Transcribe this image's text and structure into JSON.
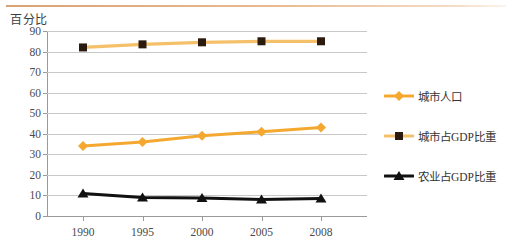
{
  "chart_data": {
    "type": "line",
    "title": "百分比",
    "xlabel": "",
    "ylabel": "百分比",
    "categories": [
      "1990",
      "1995",
      "2000",
      "2005",
      "2008"
    ],
    "x": [
      1990,
      1995,
      2000,
      2005,
      2008
    ],
    "ylim": [
      0,
      90
    ],
    "yticks": [
      0,
      10,
      20,
      30,
      40,
      50,
      60,
      70,
      80,
      90
    ],
    "ytick_labels": [
      "0",
      "10",
      "20",
      "30",
      "40",
      "50",
      "60",
      "70",
      "80",
      "90"
    ],
    "grid": true,
    "legend_position": "right",
    "series": [
      {
        "name": "城市人口",
        "values": [
          34,
          36,
          39,
          41,
          43
        ],
        "color": "#F5A830",
        "marker": "diamond",
        "marker_color": "#F5A830"
      },
      {
        "name": "城市占GDP比重",
        "values": [
          82,
          83.5,
          84.5,
          85,
          85
        ],
        "color": "#F5C06A",
        "marker": "square",
        "marker_color": "#2B1A0E"
      },
      {
        "name": "农业占GDP比重",
        "values": [
          11,
          9,
          8.7,
          8,
          8.5
        ],
        "color": "#111111",
        "marker": "triangle",
        "marker_color": "#111111"
      }
    ]
  },
  "legend": {
    "items": [
      {
        "label": "城市人口",
        "marker": "diamond-marker"
      },
      {
        "label": "城市占GDP比重",
        "marker": "square-marker"
      },
      {
        "label": "农业占GDP比重",
        "marker": "triangle-marker"
      }
    ]
  },
  "colors": {
    "orange": "#F5A830",
    "orange_light": "#F5C06A",
    "black": "#111111",
    "grid": "#C8C8C8",
    "axis": "#9A9A9A",
    "top_rule": "#D9A273"
  }
}
